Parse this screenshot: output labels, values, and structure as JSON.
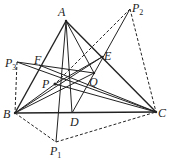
{
  "diagram": {
    "points": {
      "A": [
        66,
        21
      ],
      "B": [
        15,
        113
      ],
      "C": [
        156,
        112
      ],
      "D": [
        72,
        113
      ],
      "E": [
        102,
        57
      ],
      "F": [
        39,
        65
      ],
      "P": [
        55,
        84
      ],
      "Q": [
        94,
        73
      ],
      "P1": [
        56,
        142
      ],
      "P2": [
        130,
        9
      ],
      "P3": [
        17,
        62
      ]
    },
    "labels": [
      {
        "id": "A",
        "text": "A",
        "sub": "",
        "x": 58,
        "y": 6
      },
      {
        "id": "B",
        "text": "B",
        "sub": "",
        "x": 3,
        "y": 108
      },
      {
        "id": "C",
        "text": "C",
        "sub": "",
        "x": 158,
        "y": 107
      },
      {
        "id": "D",
        "text": "D",
        "sub": "",
        "x": 70,
        "y": 116
      },
      {
        "id": "E",
        "text": "E",
        "sub": "",
        "x": 104,
        "y": 50
      },
      {
        "id": "F",
        "text": "F",
        "sub": "",
        "x": 34,
        "y": 54
      },
      {
        "id": "P",
        "text": "P",
        "sub": "",
        "x": 42,
        "y": 78
      },
      {
        "id": "Q",
        "text": "Q",
        "sub": "",
        "x": 89,
        "y": 76
      },
      {
        "id": "P1",
        "text": "P",
        "sub": "1",
        "x": 50,
        "y": 145
      },
      {
        "id": "P2",
        "text": "P",
        "sub": "2",
        "x": 132,
        "y": 2
      },
      {
        "id": "P3",
        "text": "P",
        "sub": "3",
        "x": 5,
        "y": 57
      }
    ]
  }
}
